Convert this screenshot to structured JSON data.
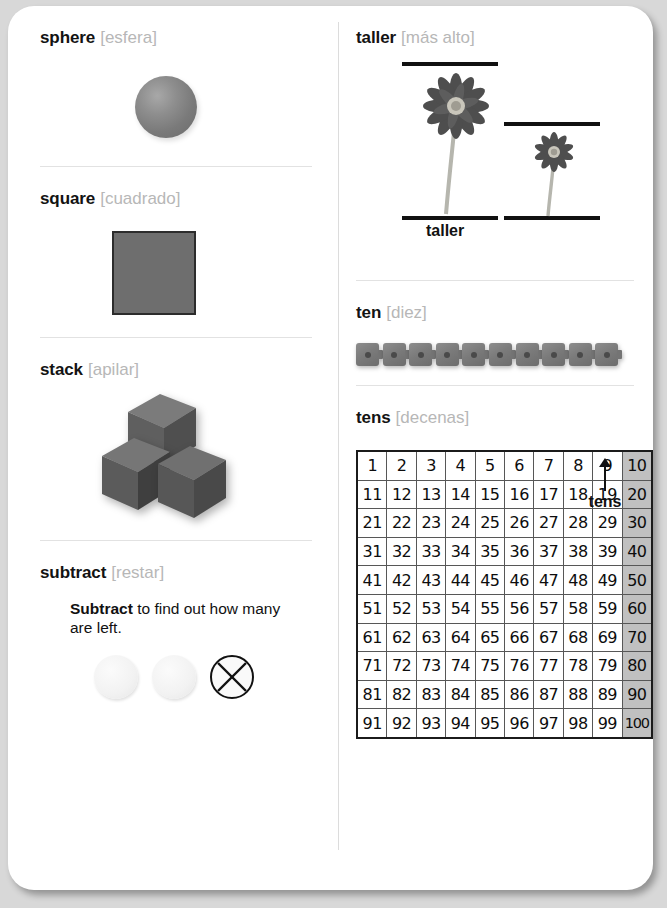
{
  "page": {
    "background_color": "#d8d8d8",
    "card_color": "#ffffff"
  },
  "left_column": {
    "entries": [
      {
        "id": "sphere",
        "term_en": "sphere",
        "term_es": "[esfera]",
        "figure": "gray-sphere"
      },
      {
        "id": "square",
        "term_en": "square",
        "term_es": "[cuadrado]",
        "figure": "gray-square"
      },
      {
        "id": "stack",
        "term_en": "stack",
        "term_es": "[apilar]",
        "figure": "three-stacked-cubes"
      },
      {
        "id": "subtract",
        "term_en": "subtract",
        "term_es": "[restar]",
        "sentence_bold": "Subtract",
        "sentence_rest": " to find out how many are left.",
        "counters": [
          "plain",
          "plain",
          "crossed-out"
        ]
      }
    ]
  },
  "right_column": {
    "entries": [
      {
        "id": "taller",
        "term_en": "taller",
        "term_es": "[más alto]",
        "caption": "taller",
        "figure": "two-flowers-between-rules"
      },
      {
        "id": "ten",
        "term_en": "ten",
        "term_es": "[diez]",
        "figure": "ten-snap-cubes",
        "cube_count": 10
      },
      {
        "id": "tens",
        "term_en": "tens",
        "term_es": "[decenas]",
        "figure": "hundreds-chart"
      }
    ],
    "hundreds_chart": {
      "rows": [
        [
          "1",
          "2",
          "3",
          "4",
          "5",
          "6",
          "7",
          "8",
          "9",
          "10"
        ],
        [
          "11",
          "12",
          "13",
          "14",
          "15",
          "16",
          "17",
          "18",
          "19",
          "20"
        ],
        [
          "21",
          "22",
          "23",
          "24",
          "25",
          "26",
          "27",
          "28",
          "29",
          "30"
        ],
        [
          "31",
          "32",
          "33",
          "34",
          "35",
          "36",
          "37",
          "38",
          "39",
          "40"
        ],
        [
          "41",
          "42",
          "43",
          "44",
          "45",
          "46",
          "47",
          "48",
          "49",
          "50"
        ],
        [
          "51",
          "52",
          "53",
          "54",
          "55",
          "56",
          "57",
          "58",
          "59",
          "60"
        ],
        [
          "61",
          "62",
          "63",
          "64",
          "65",
          "66",
          "67",
          "68",
          "69",
          "70"
        ],
        [
          "71",
          "72",
          "73",
          "74",
          "75",
          "76",
          "77",
          "78",
          "79",
          "80"
        ],
        [
          "81",
          "82",
          "83",
          "84",
          "85",
          "86",
          "87",
          "88",
          "89",
          "90"
        ],
        [
          "91",
          "92",
          "93",
          "94",
          "95",
          "96",
          "97",
          "98",
          "99",
          "100"
        ]
      ],
      "highlight_column_index": 9,
      "highlight_color": "#c0c0c0",
      "pointer_label": "tens"
    }
  },
  "colors": {
    "term_en": "#131313",
    "term_es": "#b7b7b7",
    "figure_gray": "#7a7a7a",
    "rule": "#e2e2e2"
  }
}
